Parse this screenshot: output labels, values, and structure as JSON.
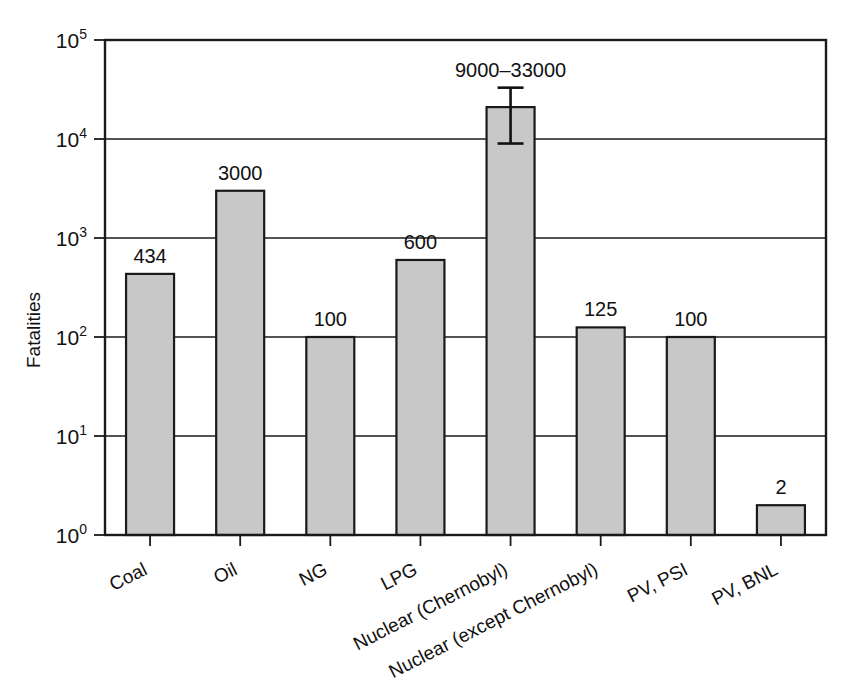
{
  "chart_data": {
    "type": "bar",
    "title": "",
    "xlabel": "",
    "ylabel": "Fatalities",
    "yscale": "log",
    "ylim": [
      1,
      100000
    ],
    "grid": true,
    "legend": null,
    "categories": [
      "Coal",
      "Oil",
      "NG",
      "LPG",
      "Nuclear (Chernobyl)",
      "Nuclear (except Chernobyl)",
      "PV, PSI",
      "PV, BNL"
    ],
    "values": [
      434,
      3000,
      100,
      600,
      21000,
      125,
      100,
      2
    ],
    "value_labels": [
      "434",
      "3000",
      "100",
      "600",
      "9000–33000",
      "125",
      "100",
      "2"
    ],
    "error_bars": [
      {
        "category": "Nuclear (Chernobyl)",
        "low": 9000,
        "high": 33000,
        "label": "9000–33000"
      }
    ],
    "y_ticks": [
      1,
      10,
      100,
      1000,
      10000,
      100000
    ],
    "y_tick_labels": [
      {
        "base": "10",
        "exp": "0"
      },
      {
        "base": "10",
        "exp": "1"
      },
      {
        "base": "10",
        "exp": "2"
      },
      {
        "base": "10",
        "exp": "3"
      },
      {
        "base": "10",
        "exp": "4"
      },
      {
        "base": "10",
        "exp": "5"
      }
    ],
    "bar_fill": "#c8c8c8",
    "bar_edge": "#1a1a1a",
    "axis_color": "#1a1a1a",
    "grid_color": "#1a1a1a",
    "label_rotation_deg": -27
  }
}
